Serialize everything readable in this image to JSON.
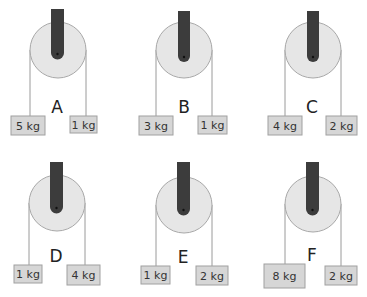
{
  "colors": {
    "pulley_fill": "#e6e6e6",
    "pulley_stroke": "#a8a8a8",
    "mount": "#3c3c3c",
    "rope": "#9a9a9a",
    "box_fill": "#d6d6d6",
    "box_stroke": "#a0a0a0"
  },
  "systems": [
    {
      "id": "A",
      "left_mass": "5 kg",
      "right_mass": "1 kg"
    },
    {
      "id": "B",
      "left_mass": "3 kg",
      "right_mass": "1 kg"
    },
    {
      "id": "C",
      "left_mass": "4 kg",
      "right_mass": "2 kg"
    },
    {
      "id": "D",
      "left_mass": "1 kg",
      "right_mass": "4 kg"
    },
    {
      "id": "E",
      "left_mass": "1 kg",
      "right_mass": "2 kg"
    },
    {
      "id": "F",
      "left_mass": "8 kg",
      "right_mass": "2 kg"
    }
  ]
}
